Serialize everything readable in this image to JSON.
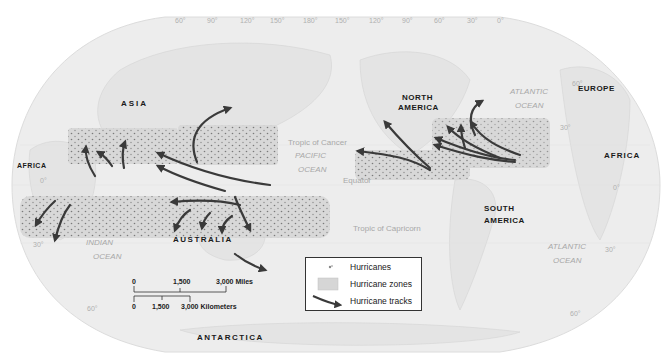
{
  "longitude_labels": [
    {
      "text": "60°",
      "x": 175
    },
    {
      "text": "90°",
      "x": 207
    },
    {
      "text": "120°",
      "x": 240
    },
    {
      "text": "150°",
      "x": 270
    },
    {
      "text": "180°",
      "x": 303
    },
    {
      "text": "150°",
      "x": 335
    },
    {
      "text": "120°",
      "x": 369
    },
    {
      "text": "90°",
      "x": 402
    },
    {
      "text": "60°",
      "x": 434
    },
    {
      "text": "30°",
      "x": 467
    },
    {
      "text": "0°",
      "x": 497
    }
  ],
  "latitude_labels": {
    "ne_60": "60°",
    "ne_30": "30°",
    "e_0": "0°",
    "se_30": "30°",
    "se_60": "60°",
    "w_0": "0°",
    "sw_30": "30°",
    "sw_60": "60°"
  },
  "continents": {
    "asia": "ASIA",
    "africa_west": "AFRICA",
    "africa_east": "AFRICA",
    "europe": "EUROPE",
    "north_america_1": "NORTH",
    "north_america_2": "AMERICA",
    "south_america_1": "SOUTH",
    "south_america_2": "AMERICA",
    "australia": "AUSTRALIA",
    "antarctica": "ANTARCTICA"
  },
  "oceans": {
    "pacific_1": "PACIFIC",
    "pacific_2": "OCEAN",
    "atlantic_n_1": "ATLANTIC",
    "atlantic_n_2": "OCEAN",
    "atlantic_s_1": "ATLANTIC",
    "atlantic_s_2": "OCEAN",
    "indian_1": "INDIAN",
    "indian_2": "OCEAN"
  },
  "lines": {
    "tropic_cancer": "Tropic of Cancer",
    "equator": "Equator",
    "tropic_capricorn": "Tropic of Capricorn"
  },
  "scale_bar": {
    "miles": {
      "zero": "0",
      "mid": "1,500",
      "end": "3,000 Miles"
    },
    "km": {
      "zero": "0",
      "mid": "1,500",
      "end": "3,000 Kilometers"
    }
  },
  "legend": {
    "items": [
      {
        "symbol": "dot-icon",
        "label": "Hurricanes"
      },
      {
        "symbol": "zone-swatch",
        "label": "Hurricane zones"
      },
      {
        "symbol": "arrow-icon",
        "label": "Hurricane tracks"
      }
    ]
  },
  "colors": {
    "map_fill": "#ececec",
    "zone_fill": "#d6d6d6",
    "dot": "#6e6e6e",
    "arrow": "#3a3a3a",
    "land_outline": "#d0d0d0"
  }
}
